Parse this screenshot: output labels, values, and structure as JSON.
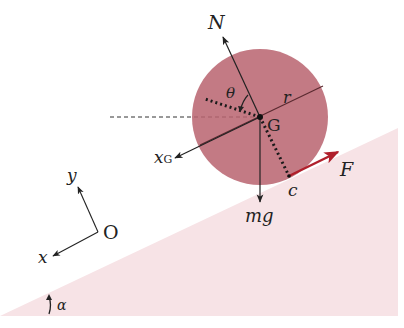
{
  "figure": {
    "colors": {
      "slope_fill": "#f7e3e6",
      "disk_fill": "#b9636e",
      "force_F": "#b0202c",
      "lines": "#222222",
      "disk_lines": "#5a2a30"
    },
    "labels": {
      "normal_force": "N",
      "angle_theta": "θ",
      "radius": "r",
      "center": "G",
      "x_G_main": "x",
      "x_G_sub": "G",
      "contact_point": "c",
      "applied_force": "F",
      "weight": "mg",
      "axis_y": "y",
      "axis_x": "x",
      "origin": "O",
      "slope_angle": "α"
    }
  }
}
